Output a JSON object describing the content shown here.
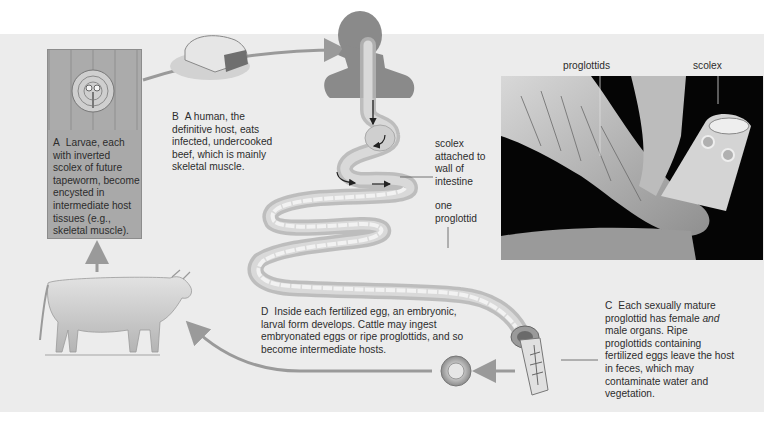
{
  "diagram": {
    "colors": {
      "background_panel": "#ececec",
      "arrow": "#9a9a9a",
      "box_a": "#a9a9a9",
      "human_silhouette": "#8a8a8a",
      "photo_bg": "#050505"
    },
    "steps": [
      {
        "letter": "A",
        "text": "Larvae, each with inverted scolex of future tapeworm, become encysted in intermediate host tissues (e.g., skeletal muscle)."
      },
      {
        "letter": "B",
        "text": "A human, the definitive host, eats infected, undercooked beef, which is mainly skeletal muscle."
      },
      {
        "letter": "C",
        "text_before_italic": "Each sexually mature proglottid has female ",
        "italic": "and",
        "text_after_italic": " male organs. Ripe proglottids containing fertilized eggs leave the host in feces, which may contaminate water and vegetation."
      },
      {
        "letter": "D",
        "text": "Inside each fertilized egg, an embryonic, larval form develops. Cattle may ingest embryonated eggs or ripe proglottids, and so become intermediate hosts."
      }
    ],
    "labels": {
      "scolex_attached": "scolex attached to wall of intestine",
      "one_proglottid": "one proglottid",
      "photo_proglottids": "proglottids",
      "photo_scolex": "scolex"
    },
    "illustrations": [
      "encysted-larva-in-muscle",
      "raw-beef-cut",
      "human-silhouette-with-digestive-tract",
      "tapeworm-in-intestine",
      "micrograph-tapeworm-scolex",
      "ripe-proglottid",
      "fertilized-egg",
      "cow"
    ]
  }
}
